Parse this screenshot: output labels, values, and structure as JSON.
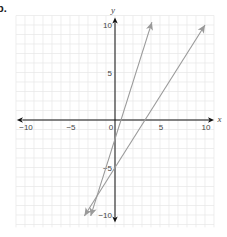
{
  "problem": {
    "label": "b."
  },
  "chart_data": {
    "type": "line",
    "title": "",
    "xlabel": "x",
    "ylabel": "y",
    "xlim": [
      -10,
      10
    ],
    "ylim": [
      -10,
      10
    ],
    "grid": true,
    "legend": null,
    "x_ticks": [
      -10,
      -5,
      0,
      5,
      10
    ],
    "y_ticks": [
      -10,
      -5,
      5,
      10
    ],
    "x_tick_labels": [
      "−10",
      "−5",
      "0",
      "5",
      "10"
    ],
    "y_tick_labels": [
      "−10",
      "−5",
      "5",
      "10"
    ],
    "series": [
      {
        "name": "line 1",
        "equation": "y = 3x - 2",
        "slope": 3,
        "intercept": -2,
        "x": [
          -2.7,
          4.1
        ],
        "y": [
          -10.1,
          10.3
        ],
        "color": "#9a9a9a",
        "arrows": "both"
      },
      {
        "name": "line 2",
        "equation": "y = 1.5x - 5",
        "slope": 1.5,
        "intercept": -5,
        "x": [
          -3.4,
          10.0
        ],
        "y": [
          -10.1,
          10.0
        ],
        "color": "#9a9a9a",
        "arrows": "both"
      }
    ]
  },
  "colors": {
    "grid": "#e6e6e6",
    "axis": "#111111",
    "line": "#9a9a9a",
    "background": "#ffffff"
  }
}
